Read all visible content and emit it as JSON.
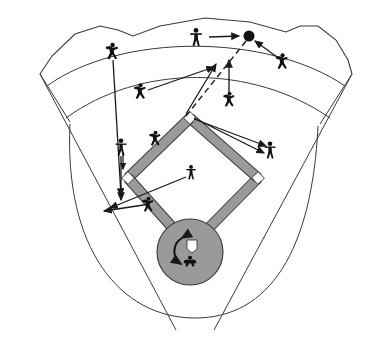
{
  "diagram": {
    "type": "sports-play-diagram",
    "sport": "baseball",
    "view": "overhead-perspective",
    "canvas": {
      "width": 384,
      "height": 341
    }
  },
  "colors": {
    "background": "#ffffff",
    "outline": "#3a3a3a",
    "base_path_fill": "#9a9a9a",
    "base_path_stroke": "#3a3a3a",
    "home_circle_fill": "#9a9a9a",
    "home_circle_stroke": "#3a3a3a",
    "base_marker_fill": "#ffffff",
    "player_fill": "#111111",
    "ball_fill": "#111111",
    "arrow_stroke": "#1a1a1a",
    "dashed_stroke": "#1a1a1a"
  },
  "field": {
    "outer_wall_label": "outfield-wall",
    "warning_track_label": "warning-track-arc",
    "infield_arc_label": "infield-grass-arc",
    "foul_line_left_label": "left-foul-line",
    "foul_line_right_label": "right-foul-line",
    "backstop_label": "backstop-curve",
    "outer_wall_path": "M 40 74 L 52 56 L 75 34 L 100 26 L 118 30 L 133 36 L 160 26 L 205 18 L 250 22 L 286 32 L 300 26 L 318 26 L 336 40 L 348 60 L 352 74",
    "wall_left_vertex": [
      40,
      74
    ],
    "wall_right_vertex": [
      352,
      74
    ],
    "foul_line_left_path": "M 40 74 L 175 326",
    "foul_line_right_path": "M 352 74 L 215 326",
    "warning_track_path": "M 48 86 C 120 36 270 36 344 86",
    "infield_arc_path": "M 66 116 C 140 66 250 66 330 116",
    "backstop_path": "M 62 120 C 62 250 120 316 195 316 C 268 316 310 252 312 124",
    "ground_left_path": "M 40 74 L 68 120",
    "ground_right_path": "M 352 74 L 318 122"
  },
  "infield": {
    "label": "infield-diamond",
    "bases": [
      {
        "name": "home-plate",
        "x": 190,
        "y": 247,
        "marker": "pentagon"
      },
      {
        "name": "first-base",
        "x": 258,
        "y": 178,
        "marker": "square"
      },
      {
        "name": "second-base",
        "x": 190,
        "y": 118,
        "marker": "square"
      },
      {
        "name": "third-base",
        "x": 128,
        "y": 178,
        "marker": "square"
      }
    ],
    "path_width_px": 9,
    "home_circle": {
      "cx": 190,
      "cy": 252,
      "r": 33
    },
    "home_plate_marker": {
      "cx": 192,
      "cy": 246,
      "size": 11
    },
    "rotation_arrow_label": "home-plate-rotation-arrow"
  },
  "ball": {
    "label": "baseball",
    "x": 249,
    "y": 36,
    "radius": 5.5
  },
  "players": [
    {
      "id": "p1",
      "name": "player-left-fielder",
      "x": 112,
      "y": 52,
      "pose": "running",
      "scale": 1.0
    },
    {
      "id": "p2",
      "name": "player-left-center-fielder",
      "x": 140,
      "y": 92,
      "pose": "running",
      "scale": 0.95
    },
    {
      "id": "p3",
      "name": "player-center-fielder",
      "x": 196,
      "y": 38,
      "pose": "standing",
      "scale": 1.05
    },
    {
      "id": "p4",
      "name": "player-right-fielder",
      "x": 282,
      "y": 62,
      "pose": "running",
      "scale": 0.95
    },
    {
      "id": "p5",
      "name": "player-second-baseman",
      "x": 229,
      "y": 100,
      "pose": "running",
      "scale": 0.9
    },
    {
      "id": "p6",
      "name": "player-shortstop",
      "x": 155,
      "y": 139,
      "pose": "running",
      "scale": 0.9
    },
    {
      "id": "p7",
      "name": "player-third-baseman",
      "x": 121,
      "y": 148,
      "pose": "standing",
      "scale": 1.0
    },
    {
      "id": "p8",
      "name": "player-first-baseman",
      "x": 270,
      "y": 151,
      "pose": "standing",
      "scale": 1.0
    },
    {
      "id": "p9",
      "name": "player-pitcher",
      "x": 191,
      "y": 173,
      "pose": "standing",
      "scale": 0.85
    },
    {
      "id": "p10",
      "name": "player-baserunner-third",
      "x": 148,
      "y": 205,
      "pose": "running",
      "scale": 0.9
    },
    {
      "id": "p11",
      "name": "player-catcher",
      "x": 190,
      "y": 263,
      "pose": "crouching",
      "scale": 0.95
    }
  ],
  "movement_arrows": [
    {
      "name": "arrow-center-fielder-to-ball",
      "from": [
        210,
        37
      ],
      "to": [
        241,
        36
      ],
      "style": "solid"
    },
    {
      "name": "arrow-right-fielder-to-ball",
      "from": [
        277,
        57
      ],
      "to": [
        254,
        40
      ],
      "style": "solid"
    },
    {
      "name": "arrow-left-fielder-long-run",
      "from": [
        112,
        58
      ],
      "to": [
        121,
        196
      ],
      "style": "solid"
    },
    {
      "name": "arrow-left-center-to-cutoff",
      "from": [
        147,
        90
      ],
      "to": [
        215,
        66
      ],
      "style": "solid"
    },
    {
      "name": "arrow-second-baseman-upfield",
      "from": [
        229,
        95
      ],
      "to": [
        229,
        60
      ],
      "style": "solid"
    },
    {
      "name": "arrow-second-base-to-cutoff",
      "from": [
        196,
        117
      ],
      "to": [
        219,
        63
      ],
      "style": "solid"
    },
    {
      "name": "arrow-second-base-to-first",
      "from": [
        196,
        118
      ],
      "to": [
        264,
        152
      ],
      "style": "solid"
    },
    {
      "name": "arrow-second-base-to-right",
      "from": [
        196,
        118
      ],
      "to": [
        267,
        148
      ],
      "style": "solid"
    },
    {
      "name": "arrow-third-baseman-short-down",
      "from": [
        123,
        152
      ],
      "to": [
        123,
        168
      ],
      "style": "solid"
    },
    {
      "name": "arrow-third-base-down-long",
      "from": [
        121,
        155
      ],
      "to": [
        121,
        199
      ],
      "style": "solid"
    },
    {
      "name": "arrow-pitcher-to-foul-left",
      "from": [
        186,
        177
      ],
      "to": [
        110,
        209
      ],
      "style": "solid"
    },
    {
      "name": "arrow-baserunner-to-left-foul",
      "from": [
        150,
        203
      ],
      "to": [
        105,
        210
      ],
      "style": "solid"
    }
  ],
  "trajectory": {
    "name": "ball-trajectory-dashed",
    "style": "dashed",
    "from": [
      186,
      116
    ],
    "to": [
      246,
      41
    ],
    "dash_pattern": "6,4"
  },
  "legend_note": ""
}
